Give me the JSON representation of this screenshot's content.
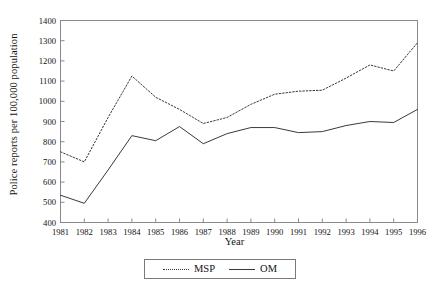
{
  "chart_data": {
    "type": "line",
    "title": "",
    "xlabel": "Year",
    "ylabel": "Police reports per 100,000 population",
    "categories": [
      1981,
      1982,
      1983,
      1984,
      1985,
      1986,
      1987,
      1988,
      1989,
      1990,
      1991,
      1992,
      1993,
      1994,
      1995,
      1996
    ],
    "xtick_labels": [
      "1981",
      "1982",
      "1983",
      "1984",
      "1985",
      "1986",
      "1987",
      "1988",
      "1989",
      "1990",
      "1991",
      "1992",
      "1993",
      "1994",
      "1995",
      "1996"
    ],
    "ytick_labels": [
      "400",
      "500",
      "600",
      "700",
      "800",
      "900",
      "1000",
      "1100",
      "1200",
      "1300",
      "1400"
    ],
    "yticks": [
      400,
      500,
      600,
      700,
      800,
      900,
      1000,
      1100,
      1200,
      1300,
      1400
    ],
    "ylim": [
      400,
      1400
    ],
    "xlim": [
      1981,
      1996
    ],
    "grid": false,
    "legend_position": "below-center",
    "series": [
      {
        "name": "MSP",
        "style": "dotted",
        "color": "#3a3a3a",
        "values": [
          750,
          700,
          920,
          1125,
          1020,
          960,
          890,
          920,
          985,
          1035,
          1050,
          1055,
          1115,
          1180,
          1150,
          1290
        ]
      },
      {
        "name": "OM",
        "style": "solid",
        "color": "#3a3a3a",
        "values": [
          535,
          495,
          660,
          830,
          805,
          875,
          790,
          840,
          870,
          870,
          845,
          850,
          880,
          900,
          895,
          960
        ]
      }
    ]
  },
  "legend": {
    "entries": [
      {
        "label": "MSP",
        "style": "dotted"
      },
      {
        "label": "OM",
        "style": "solid"
      }
    ]
  },
  "axes": {
    "x_title": "Year",
    "y_title": "Police reports per 100,000 population"
  }
}
